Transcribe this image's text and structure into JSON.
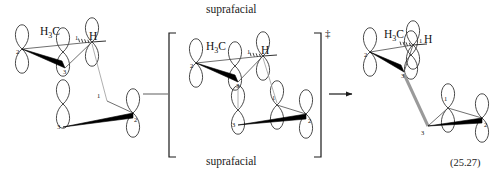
{
  "figure": {
    "kind": "orbital-overlap-reaction-scheme",
    "equation_number": "(25.27)",
    "top_label": "suprafacial",
    "bottom_label": "suprafacial",
    "transition_state_marker": "‡",
    "reaction_arrow": "→",
    "bracket_left": "[",
    "bracket_right": "]",
    "colors": {
      "stroke": "#1a1a1a",
      "thin_bond": "#4a4a4a",
      "bold_wedge": "#000000",
      "forming_bond": "#9a9a9a",
      "orbital_outline": "#2b2b2b",
      "text": "#222222",
      "background": "#ffffff"
    }
  },
  "structures": [
    {
      "id": "reactant",
      "name": "reactant",
      "substituents": [
        {
          "text": "H3C",
          "display": "H",
          "sub": "3",
          "tail": "C",
          "bond": "hashed-wedge"
        },
        {
          "text": "H",
          "display": "H",
          "bond": "plain"
        }
      ],
      "upper_fragment": {
        "atoms": [
          "2",
          "3",
          "1"
        ]
      },
      "lower_fragment": {
        "atoms": [
          "1",
          "2",
          "3"
        ]
      }
    },
    {
      "id": "transition-state",
      "name": "transition state",
      "bracketed": true,
      "marker": "‡",
      "substituents": [
        {
          "text": "H3C",
          "display": "H",
          "sub": "3",
          "tail": "C",
          "bond": "hashed-wedge"
        },
        {
          "text": "H",
          "display": "H",
          "bond": "plain"
        }
      ],
      "upper_fragment": {
        "atoms": [
          "2",
          "3",
          "1"
        ]
      },
      "lower_fragment": {
        "atoms": [
          "1",
          "2",
          "3"
        ]
      }
    },
    {
      "id": "product",
      "name": "product",
      "substituents": [
        {
          "text": "H3C",
          "display": "H",
          "sub": "3",
          "tail": "C",
          "bond": "hashed-wedge"
        },
        {
          "text": "H",
          "display": "H",
          "bond": "plain"
        }
      ],
      "upper_fragment": {
        "atoms": [
          "2",
          "3",
          "1"
        ]
      },
      "lower_fragment": {
        "atoms": [
          "1",
          "2",
          "3"
        ]
      },
      "forming_sigma_bond": {
        "from": "3",
        "to": "3",
        "style": "gray"
      }
    }
  ],
  "atom_numbers": {
    "reactant_upper": [
      "2",
      "1",
      "3"
    ],
    "reactant_lower": [
      "1",
      "2",
      "3"
    ],
    "ts_upper": [
      "2",
      "1",
      "3"
    ],
    "ts_lower": [
      "1",
      "2",
      "3"
    ],
    "product_upper": [
      "2",
      "1",
      "3"
    ],
    "product_lower": [
      "1",
      "2",
      "3"
    ]
  }
}
